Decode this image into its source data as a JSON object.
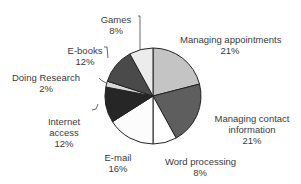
{
  "chart_data": {
    "type": "pie",
    "title": "",
    "start_angle": "12 o'clock",
    "direction": "clockwise",
    "slices": [
      {
        "label": "Managing appointments",
        "value": 21,
        "display": "21%",
        "color": "#c4c4c4"
      },
      {
        "label": "Managing contact information",
        "value": 21,
        "display": "21%",
        "color": "#5e5e5e"
      },
      {
        "label": "Word processing",
        "value": 8,
        "display": "8%",
        "color": "#ffffff"
      },
      {
        "label": "E-mail",
        "value": 16,
        "display": "16%",
        "color": "#fcfcfc"
      },
      {
        "label": "Internet access",
        "value": 12,
        "display": "12%",
        "color": "#262626"
      },
      {
        "label": "Doing Research",
        "value": 2,
        "display": "2%",
        "color": "#d8d8d8"
      },
      {
        "label": "E-books",
        "value": 12,
        "display": "12%",
        "color": "#4a4a4a"
      },
      {
        "label": "Games",
        "value": 8,
        "display": "8%",
        "color": "#ececec"
      }
    ],
    "legend": "none (direct labels)"
  },
  "labels": {
    "managing_appointments": {
      "name": "Managing appointments",
      "pct": "21%"
    },
    "managing_contact": {
      "name1": "Managing contact",
      "name2": "information",
      "pct": "21%"
    },
    "word_processing": {
      "name": "Word processing",
      "pct": "8%"
    },
    "email": {
      "name": "E-mail",
      "pct": "16%"
    },
    "internet_access": {
      "name1": "Internet",
      "name2": "access",
      "pct": "12%"
    },
    "doing_research": {
      "name": "Doing Research",
      "pct": "2%"
    },
    "ebooks": {
      "name": "E-books",
      "pct": "12%"
    },
    "games": {
      "name": "Games",
      "pct": "8%"
    }
  }
}
